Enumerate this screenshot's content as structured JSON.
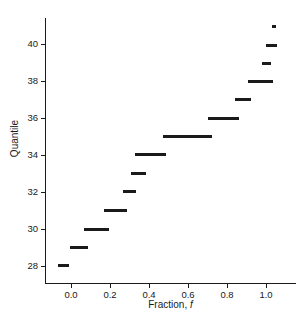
{
  "chart_data": {
    "type": "line",
    "subtype": "step-quantile-function",
    "title": "",
    "xlabel": "Fraction, f",
    "xlabel_plain": "Fraction,",
    "xlabel_italic": "f",
    "ylabel": "Quantile",
    "xlim": [
      -0.05,
      1.08
    ],
    "ylim": [
      27.2,
      41.6
    ],
    "grid": false,
    "legend": null,
    "xticks": [
      0.0,
      0.2,
      0.4,
      0.6,
      0.8,
      1.0
    ],
    "xtick_labels": [
      "0.0",
      "0.2",
      "0.4",
      "0.6",
      "0.8",
      "1.0"
    ],
    "yticks": [
      28,
      30,
      32,
      34,
      36,
      38,
      40
    ],
    "ytick_labels": [
      "28",
      "30",
      "32",
      "34",
      "36",
      "38",
      "40"
    ],
    "marker_color": "#1a1a1a",
    "background_color": "#ffffff",
    "axis_color": "#1a1a1a",
    "series": [
      {
        "name": "Empirical quantile",
        "steps": [
          {
            "quantile": 28,
            "f_start": 0.0,
            "f_end": 0.045
          },
          {
            "quantile": 29,
            "f_start": 0.048,
            "f_end": 0.125
          },
          {
            "quantile": 30,
            "f_start": 0.128,
            "f_end": 0.225
          },
          {
            "quantile": 31,
            "f_start": 0.228,
            "f_end": 0.315
          },
          {
            "quantile": 32,
            "f_start": 0.318,
            "f_end": 0.363
          },
          {
            "quantile": 33,
            "f_start": 0.347,
            "f_end": 0.4
          },
          {
            "quantile": 34,
            "f_start": 0.363,
            "f_end": 0.482
          },
          {
            "quantile": 35,
            "f_start": 0.475,
            "f_end": 0.67
          },
          {
            "quantile": 36,
            "f_start": 0.655,
            "f_end": 0.775
          },
          {
            "quantile": 37,
            "f_start": 0.763,
            "f_end": 0.822
          },
          {
            "quantile": 38,
            "f_start": 0.812,
            "f_end": 0.908
          },
          {
            "quantile": 39,
            "f_start": 0.868,
            "f_end": 0.9
          },
          {
            "quantile": 40,
            "f_start": 0.888,
            "f_end": 0.928
          },
          {
            "quantile": 41,
            "f_start": 0.916,
            "f_end": 0.928
          }
        ]
      }
    ]
  },
  "geometry": {
    "plot_left_px": 45,
    "plot_right_px": 296,
    "plot_top_px": 18,
    "plot_bottom_px": 283,
    "x_at_0_px": 71,
    "x_at_1_px": 266,
    "y_at_28_px": 266,
    "y_at_40_px": 44,
    "segments_px": [
      {
        "quantile": 28,
        "left": 58,
        "width": 11,
        "top": 264
      },
      {
        "quantile": 29,
        "left": 70,
        "width": 18,
        "top": 246
      },
      {
        "quantile": 30,
        "left": 84,
        "width": 25,
        "top": 228
      },
      {
        "quantile": 31,
        "left": 104,
        "width": 23,
        "top": 209
      },
      {
        "quantile": 32,
        "left": 123,
        "width": 13,
        "top": 190
      },
      {
        "quantile": 33,
        "left": 131,
        "width": 15,
        "top": 172
      },
      {
        "quantile": 34,
        "left": 135,
        "width": 31,
        "top": 153
      },
      {
        "quantile": 35,
        "left": 163,
        "width": 49,
        "top": 135
      },
      {
        "quantile": 36,
        "left": 208,
        "width": 31,
        "top": 117
      },
      {
        "quantile": 37,
        "left": 235,
        "width": 16,
        "top": 98
      },
      {
        "quantile": 38,
        "left": 248,
        "width": 25,
        "top": 80
      },
      {
        "quantile": 39,
        "left": 262,
        "width": 9,
        "top": 62
      },
      {
        "quantile": 40,
        "left": 266,
        "width": 11,
        "top": 44
      },
      {
        "quantile": 41,
        "left": 272,
        "width": 4,
        "top": 25
      }
    ],
    "xtick_px": [
      71,
      110,
      149,
      188,
      227,
      266
    ],
    "ytick_px": [
      266,
      229,
      192,
      155,
      118,
      81,
      44
    ]
  }
}
